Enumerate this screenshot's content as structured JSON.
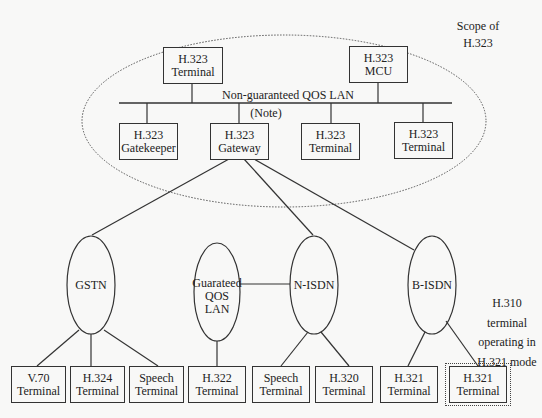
{
  "diagram": {
    "scope_label": [
      "Scope of",
      "H.323"
    ],
    "lan_label": "Non-guaranteed QOS LAN",
    "note_label": "(Note)",
    "h323_nodes": {
      "terminal_top": [
        "H.323",
        "Terminal"
      ],
      "mcu": [
        "H.323",
        "MCU"
      ],
      "gatekeeper": [
        "H.323",
        "Gatekeeper"
      ],
      "gateway": [
        "H.323",
        "Gateway"
      ],
      "terminal_mid": [
        "H.323",
        "Terminal"
      ],
      "terminal_right": [
        "H.323",
        "Terminal"
      ]
    },
    "networks": {
      "gstn": "GSTN",
      "gqos": [
        "Guarateed",
        "QOS",
        "LAN"
      ],
      "nisdn": "N-ISDN",
      "bisdn": "B-ISDN"
    },
    "terminals": [
      [
        "V.70",
        "Terminal"
      ],
      [
        "H.324",
        "Terminal"
      ],
      [
        "Speech",
        "Terminal"
      ],
      [
        "H.322",
        "Terminal"
      ],
      [
        "Speech",
        "Terminal"
      ],
      [
        "H.320",
        "Terminal"
      ],
      [
        "H.321",
        "Terminal"
      ],
      [
        "H.321",
        "Terminal"
      ]
    ],
    "h310_note": [
      "H.310",
      "terminal",
      "operating in",
      "H.321 mode"
    ]
  }
}
